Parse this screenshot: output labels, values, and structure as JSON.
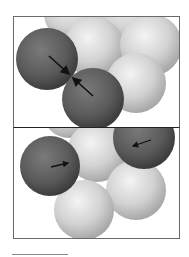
{
  "figure": {
    "type": "sphere-packing-diagram",
    "panels": [
      {
        "id": "top",
        "description": "Two dark spheres in contact with arrows pointing toward each other at the contact point",
        "arrows": [
          {
            "from": [
              35,
              39
            ],
            "to": [
              55,
              57
            ],
            "direction": "inward"
          },
          {
            "from": [
              79,
              79
            ],
            "to": [
              59,
              61
            ],
            "direction": "inward"
          }
        ]
      },
      {
        "id": "bottom",
        "description": "Two dark spheres separated, each with a small arrow pointing inward",
        "arrows": [
          {
            "from": [
              37,
              39
            ],
            "to": [
              54,
              35
            ],
            "direction": "right"
          },
          {
            "from": [
              137,
              12
            ],
            "to": [
              119,
              18
            ],
            "direction": "left"
          }
        ]
      }
    ]
  },
  "colors": {
    "dark_sphere": "#5a5a5a",
    "light_sphere": "#d4d4d4",
    "frame": "#6a6a6a",
    "separator": "#222222",
    "arrow": "#111111"
  }
}
